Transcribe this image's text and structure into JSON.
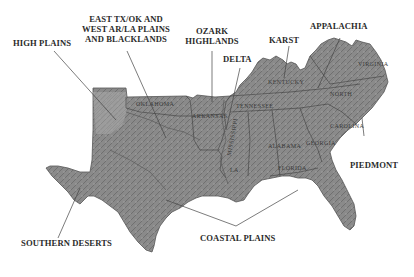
{
  "map": {
    "subject": "Physiographic regions of the southern United States",
    "style": "grayscale shaded relief",
    "colors": {
      "background": "#ffffff",
      "land_dark": "#6e6e6e",
      "land_mid": "#8c8c8c",
      "land_light": "#b4b4b4",
      "borders": "#3c3c3c",
      "leader_lines": "#444444",
      "label_text": "#2a2a2a"
    }
  },
  "region_labels": {
    "high_plains": "HIGH PLAINS",
    "east_tx_line1": "EAST TX/OK AND",
    "east_tx_line2": "WEST AR/LA PLAINS",
    "east_tx_line3": "AND BLACKLANDS",
    "ozark_line1": "OZARK",
    "ozark_line2": "HIGHLANDS",
    "delta": "DELTA",
    "karst": "KARST",
    "appalachia": "APPALACHIA",
    "piedmont": "PIEDMONT",
    "southern_deserts": "SOUTHERN DESERTS",
    "coastal_plains": "COASTAL PLAINS"
  },
  "state_labels": {
    "oklahoma": "OKLAHOMA",
    "arkansas": "ARKANSAS",
    "tennessee": "TENNESSEE",
    "kentucky": "KENTUCKY",
    "virginia": "VIRGINIA",
    "north_carolina": "NORTH",
    "south_carolina": "CAROLINA",
    "georgia": "GEORGIA",
    "alabama": "ALABAMA",
    "mississippi": "MISSISSIPPI",
    "louisiana": "LA",
    "florida": "FLORIDA"
  }
}
